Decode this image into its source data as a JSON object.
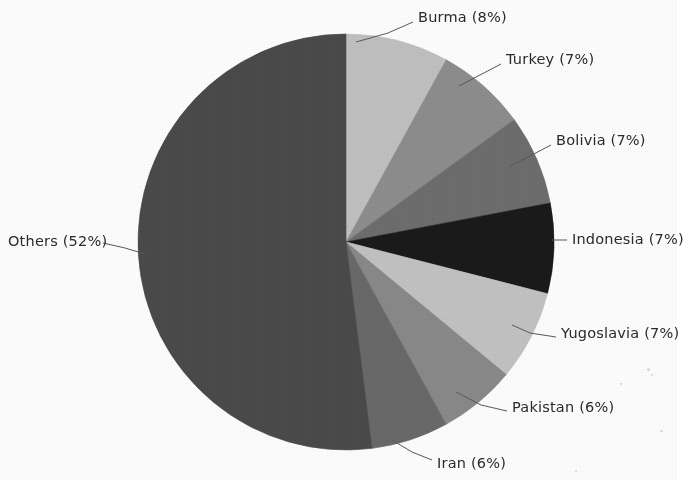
{
  "chart_data": {
    "type": "pie",
    "title": "",
    "subtitle": "",
    "xlabel": "",
    "ylabel": "",
    "legend_position": "none",
    "labels_outside": true,
    "start_angle_deg": 0,
    "direction": "clockwise",
    "center": {
      "x": 346,
      "y": 242
    },
    "radius": 208,
    "categories": [
      "Burma",
      "Turkey",
      "Bolivia",
      "Indonesia",
      "Yugoslavia",
      "Pakistan",
      "Iran",
      "Others"
    ],
    "values": [
      8,
      7,
      7,
      7,
      7,
      6,
      6,
      52
    ],
    "unit": "%",
    "colors": [
      "#c2c2c2",
      "#8e8e8e",
      "#6e6e6e",
      "#1a1a1a",
      "#c4c4c4",
      "#8a8a8a",
      "#6a6a6a",
      "#4a4a4a"
    ],
    "slices": [
      {
        "name": "Burma",
        "value": 8,
        "label": "Burma (8%)",
        "color": "#c2c2c2",
        "start_deg": 0,
        "end_deg": 28.8,
        "label_x": 418,
        "label_y": 10,
        "label_align": "left",
        "leader": [
          [
            413,
            22
          ],
          [
            388,
            33
          ],
          [
            356,
            42
          ]
        ]
      },
      {
        "name": "Turkey",
        "value": 7,
        "label": "Turkey (7%)",
        "color": "#8e8e8e",
        "start_deg": 28.8,
        "end_deg": 54.0,
        "label_x": 506,
        "label_y": 52,
        "label_align": "left",
        "leader": [
          [
            501,
            64
          ],
          [
            478,
            76
          ],
          [
            459,
            86
          ]
        ]
      },
      {
        "name": "Bolivia",
        "value": 7,
        "label": "Bolivia (7%)",
        "color": "#6e6e6e",
        "start_deg": 54.0,
        "end_deg": 79.2,
        "label_x": 556,
        "label_y": 133,
        "label_align": "left",
        "leader": [
          [
            551,
            145
          ],
          [
            528,
            157
          ],
          [
            510,
            166
          ]
        ]
      },
      {
        "name": "Indonesia",
        "value": 7,
        "label": "Indonesia (7%)",
        "color": "#1a1a1a",
        "start_deg": 79.2,
        "end_deg": 104.4,
        "label_x": 572,
        "label_y": 232,
        "label_align": "left",
        "leader": [
          [
            567,
            240
          ],
          [
            552,
            240
          ]
        ]
      },
      {
        "name": "Yugoslavia",
        "value": 7,
        "label": "Yugoslavia (7%)",
        "color": "#c4c4c4",
        "start_deg": 104.4,
        "end_deg": 129.6,
        "label_x": 561,
        "label_y": 326,
        "label_align": "left",
        "leader": [
          [
            556,
            337
          ],
          [
            530,
            333
          ],
          [
            512,
            325
          ]
        ]
      },
      {
        "name": "Pakistan",
        "value": 6,
        "label": "Pakistan (6%)",
        "color": "#8a8a8a",
        "start_deg": 129.6,
        "end_deg": 151.2,
        "label_x": 512,
        "label_y": 400,
        "label_align": "left",
        "leader": [
          [
            507,
            411
          ],
          [
            481,
            405
          ],
          [
            456,
            392
          ]
        ]
      },
      {
        "name": "Iran",
        "value": 6,
        "label": "Iran (6%)",
        "color": "#6a6a6a",
        "start_deg": 151.2,
        "end_deg": 172.8,
        "label_x": 437,
        "label_y": 456,
        "label_align": "left",
        "leader": [
          [
            432,
            460
          ],
          [
            412,
            452
          ],
          [
            392,
            440
          ]
        ]
      },
      {
        "name": "Others",
        "value": 52,
        "label": "Others (52%)",
        "color": "#4a4a4a",
        "start_deg": 172.8,
        "end_deg": 360.0,
        "label_x": 8,
        "label_y": 234,
        "label_align": "right",
        "leader": [
          [
            103,
            243
          ],
          [
            125,
            248
          ],
          [
            145,
            254
          ]
        ]
      }
    ]
  }
}
